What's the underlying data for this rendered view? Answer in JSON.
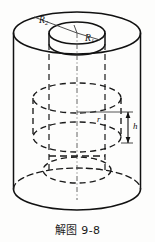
{
  "figure": {
    "caption": "解图 9-8",
    "title": "解图 9-8",
    "background_color": "#fdfdfc",
    "stroke_color": "#111111",
    "dash_color": "#1a1a1a",
    "leader_color": "#555555"
  },
  "labels": {
    "outer_radius": "R",
    "outer_radius_sub": "2",
    "inner_radius": "R",
    "inner_radius_sub": "1",
    "small_radius": "r",
    "height": "h"
  },
  "geometry": {
    "outer_cylinder": {
      "center_x": 77,
      "top_center_y": 33,
      "bottom_center_y": 189,
      "radius_x": 63.5,
      "radius_y": 21
    },
    "hole": {
      "center_x": 77,
      "center_y": 33,
      "radius_x": 28,
      "radius_y": 11,
      "depth": 17
    },
    "inner_cylinder": {
      "center_x": 77,
      "top_center_y": 98,
      "bottom_center_y": 137,
      "radius_x": 44,
      "radius_y": 15
    },
    "inner_bottom_disc": {
      "center_x": 77,
      "center_y": 170,
      "radius_x": 34,
      "radius_y": 13
    },
    "dimension_h": {
      "x": 128,
      "y_top": 112,
      "y_bottom": 143
    },
    "leader_r": {
      "x_start": 77,
      "x_end": 121,
      "y": 112
    }
  }
}
